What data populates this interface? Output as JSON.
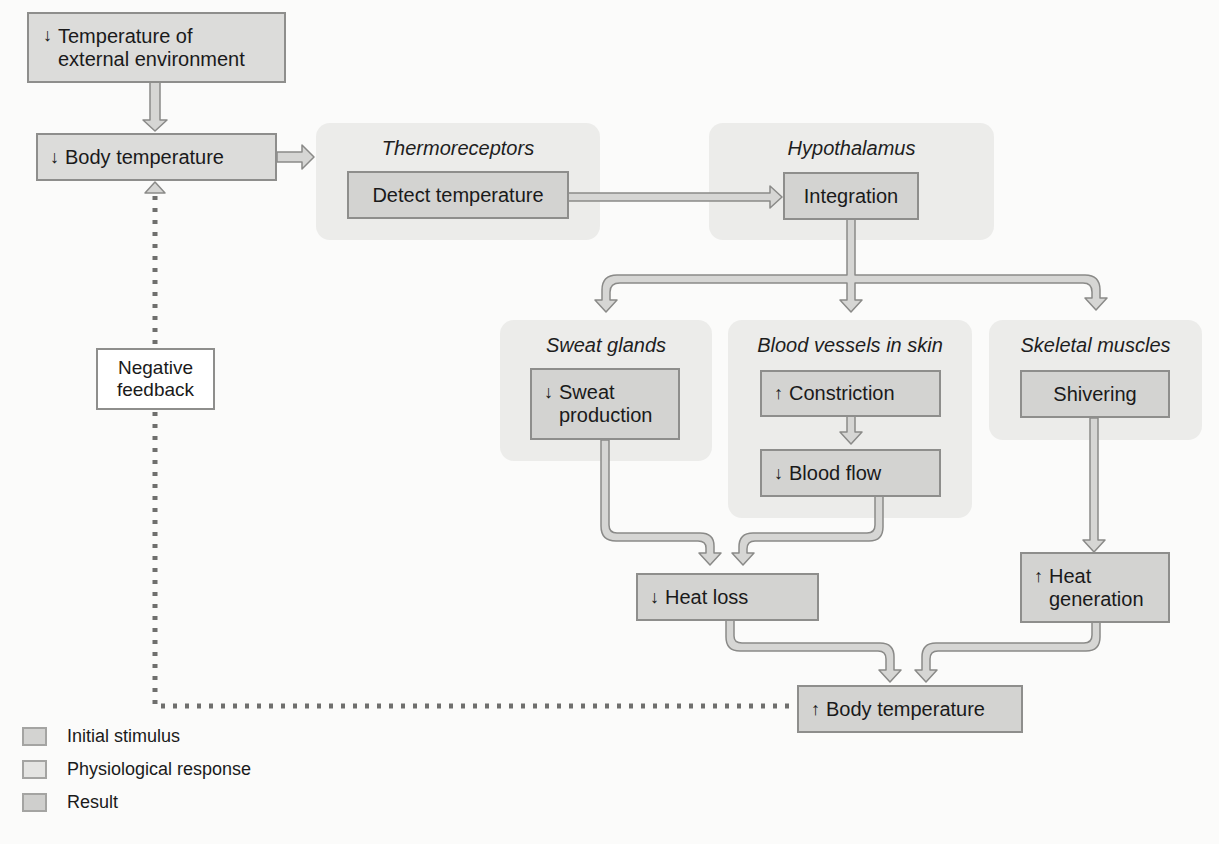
{
  "diagram": {
    "title_nodes": {
      "stimulus": {
        "arrow": "↓",
        "text": "Temperature of\nexternal environment"
      },
      "body_temp_down": {
        "arrow": "↓",
        "text": "Body temperature"
      },
      "body_temp_up": {
        "arrow": "↑",
        "text": "Body temperature"
      }
    },
    "groups": {
      "thermoreceptors": {
        "title": "Thermoreceptors",
        "box": "Detect temperature"
      },
      "hypothalamus": {
        "title": "Hypothalamus",
        "box": "Integration"
      },
      "sweat_glands": {
        "title": "Sweat glands",
        "box_arrow": "↓",
        "box": "Sweat\nproduction"
      },
      "blood_vessels": {
        "title": "Blood vessels in skin",
        "box1_arrow": "↑",
        "box1": "Constriction",
        "box2_arrow": "↓",
        "box2": "Blood flow"
      },
      "skeletal_muscles": {
        "title": "Skeletal muscles",
        "box": "Shivering"
      }
    },
    "results": {
      "heat_loss": {
        "arrow": "↓",
        "text": "Heat loss"
      },
      "heat_generation": {
        "arrow": "↑",
        "text": "Heat\ngeneration"
      }
    },
    "feedback_label": "Negative\nfeedback"
  },
  "legend": {
    "items": [
      {
        "label": "Initial stimulus",
        "color": "#d3d3d1"
      },
      {
        "label": "Physiological response",
        "color": "#e4e4e2"
      },
      {
        "label": "Result",
        "color": "#cfcfcd"
      }
    ]
  },
  "colors": {
    "group_bg": "#ececea",
    "box_fill": "#d3d3d1",
    "box_border": "#8e8e8c",
    "arrow_fill": "#d6d6d4",
    "arrow_stroke": "#8a8a88",
    "dotted_line": "#6f6f6d"
  }
}
